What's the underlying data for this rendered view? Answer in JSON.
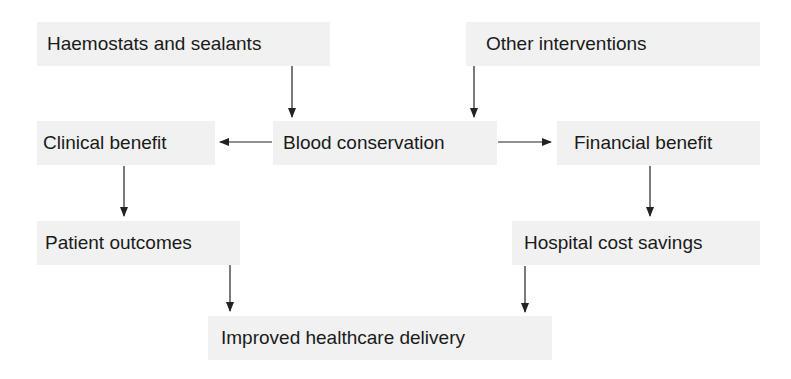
{
  "diagram": {
    "title": "",
    "nodes": [
      {
        "id": "haemostats",
        "label": "Haemostats and sealants",
        "x": 37,
        "y": 22,
        "w": 293,
        "h": 44
      },
      {
        "id": "other",
        "label": "Other interventions",
        "x": 466,
        "y": 22,
        "w": 294,
        "h": 44
      },
      {
        "id": "clinical",
        "label": "Clinical benefit",
        "x": 37,
        "y": 121,
        "w": 178,
        "h": 44
      },
      {
        "id": "blood",
        "label": "Blood conservation",
        "x": 273,
        "y": 121,
        "w": 224,
        "h": 44
      },
      {
        "id": "financial",
        "label": "Financial benefit",
        "x": 557,
        "y": 121,
        "w": 203,
        "h": 44
      },
      {
        "id": "patient",
        "label": "Patient outcomes",
        "x": 37,
        "y": 221,
        "w": 203,
        "h": 44
      },
      {
        "id": "hospital",
        "label": "Hospital cost savings",
        "x": 512,
        "y": 221,
        "w": 248,
        "h": 44
      },
      {
        "id": "improved",
        "label": "Improved healthcare delivery",
        "x": 208,
        "y": 316,
        "w": 344,
        "h": 44
      }
    ],
    "edges": [
      {
        "from": "haemostats",
        "to": "blood"
      },
      {
        "from": "other",
        "to": "blood"
      },
      {
        "from": "blood",
        "to": "clinical"
      },
      {
        "from": "blood",
        "to": "financial"
      },
      {
        "from": "clinical",
        "to": "patient"
      },
      {
        "from": "financial",
        "to": "hospital"
      },
      {
        "from": "patient",
        "to": "improved"
      },
      {
        "from": "hospital",
        "to": "improved"
      }
    ],
    "colors": {
      "node_fill": "#f1f1f1",
      "text": "#1a1a1a",
      "arrow": "#222222"
    }
  }
}
